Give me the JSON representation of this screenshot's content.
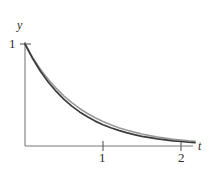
{
  "figure": {
    "background_color": "#ffffff",
    "width": 214,
    "height": 173,
    "axes": {
      "y_axis_label": "y",
      "x_axis_label": "t",
      "y_ticks": [
        {
          "label": "1",
          "value": 1
        }
      ],
      "x_ticks": [
        {
          "label": "1",
          "value": 1
        },
        {
          "label": "2",
          "value": 2
        }
      ],
      "axis_color": "#6b6b6b",
      "origin_px": {
        "x": 25,
        "y": 146
      },
      "x_unit_px": 78,
      "y_unit_px": 102
    }
  },
  "chart_data": {
    "type": "line",
    "title": "",
    "xlabel": "t",
    "ylabel": "y",
    "xlim": [
      0,
      2.18
    ],
    "ylim": [
      0,
      1.02
    ],
    "grid": false,
    "legend": "none",
    "x_ticks": [
      1,
      2
    ],
    "x_tick_labels": [
      "1",
      "2"
    ],
    "y_ticks": [
      1
    ],
    "y_tick_labels": [
      "1"
    ],
    "series": [
      {
        "name": "upper-curve",
        "color": "#9a9a9a",
        "width": 1.6,
        "description": "slower exponential decay from (0,1)",
        "x": [
          0,
          0.1,
          0.2,
          0.3,
          0.4,
          0.5,
          0.6,
          0.7,
          0.8,
          0.9,
          1.0,
          1.1,
          1.2,
          1.3,
          1.4,
          1.5,
          1.6,
          1.7,
          1.8,
          1.9,
          2.0,
          2.1,
          2.18
        ],
        "y": [
          1.0,
          0.867,
          0.751,
          0.651,
          0.565,
          0.49,
          0.425,
          0.368,
          0.319,
          0.277,
          0.24,
          0.208,
          0.18,
          0.156,
          0.136,
          0.118,
          0.102,
          0.089,
          0.077,
          0.067,
          0.058,
          0.05,
          0.045
        ]
      },
      {
        "name": "lower-curve",
        "color": "#3a3a3a",
        "width": 1.7,
        "description": "faster exponential decay from (0,1)",
        "x": [
          0,
          0.1,
          0.2,
          0.3,
          0.4,
          0.5,
          0.6,
          0.7,
          0.8,
          0.9,
          1.0,
          1.1,
          1.2,
          1.3,
          1.4,
          1.5,
          1.6,
          1.7,
          1.8,
          1.9,
          2.0,
          2.1,
          2.18
        ],
        "y": [
          1.0,
          0.855,
          0.731,
          0.625,
          0.535,
          0.457,
          0.391,
          0.334,
          0.286,
          0.244,
          0.209,
          0.179,
          0.153,
          0.131,
          0.112,
          0.095,
          0.082,
          0.07,
          0.06,
          0.051,
          0.044,
          0.037,
          0.033
        ]
      }
    ]
  }
}
